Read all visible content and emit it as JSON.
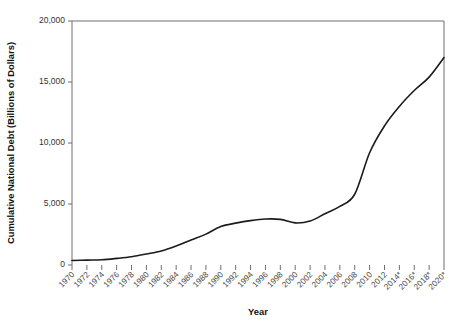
{
  "chart_data": {
    "type": "line",
    "title": "",
    "xlabel": "Year",
    "ylabel": "Cumulative National Debt (Billions of Dollars)",
    "xlim": [
      1970,
      2020
    ],
    "ylim": [
      0,
      20000
    ],
    "grid": false,
    "legend": null,
    "line_color": "#1b1b1b",
    "axis_color": "#6f6f6f",
    "note": "Years marked with an asterisk are projections",
    "ytick_labels": [
      "0",
      "5,000",
      "10,000",
      "15,000",
      "20,000"
    ],
    "ytick_values": [
      0,
      5000,
      10000,
      15000,
      20000
    ],
    "xtick_labels": [
      "1970",
      "1972",
      "1974",
      "1976",
      "1978",
      "1980",
      "1982",
      "1984",
      "1986",
      "1988",
      "1990",
      "1992",
      "1994",
      "1996",
      "1998",
      "2000",
      "2002",
      "2004",
      "2006",
      "2008",
      "2010",
      "2012",
      "2014*",
      "2016*",
      "2018*",
      "2020*"
    ],
    "categories": [
      1970,
      1972,
      1974,
      1976,
      1978,
      1980,
      1982,
      1984,
      1986,
      1988,
      1990,
      1992,
      1994,
      1996,
      1998,
      2000,
      2002,
      2004,
      2006,
      2008,
      2010,
      2012,
      2014,
      2016,
      2018,
      2020
    ],
    "values": [
      370,
      430,
      490,
      630,
      780,
      910,
      1140,
      1570,
      2130,
      2600,
      3230,
      4060,
      4690,
      5220,
      5530,
      5670,
      6200,
      7380,
      8510,
      10020,
      13560,
      16070,
      17820,
      19540,
      21500,
      23200
    ],
    "series": [
      {
        "name": "Cumulative National Debt",
        "points": [
          {
            "x": 1970,
            "y": 370
          },
          {
            "x": 1972,
            "y": 400
          },
          {
            "x": 1974,
            "y": 430
          },
          {
            "x": 1976,
            "y": 540
          },
          {
            "x": 1978,
            "y": 680
          },
          {
            "x": 1980,
            "y": 900
          },
          {
            "x": 1982,
            "y": 1150
          },
          {
            "x": 1984,
            "y": 1560
          },
          {
            "x": 1986,
            "y": 2050
          },
          {
            "x": 1988,
            "y": 2530
          },
          {
            "x": 1990,
            "y": 3150
          },
          {
            "x": 1992,
            "y": 3430
          },
          {
            "x": 1994,
            "y": 3640
          },
          {
            "x": 1996,
            "y": 3770
          },
          {
            "x": 1998,
            "y": 3740
          },
          {
            "x": 2000,
            "y": 3450
          },
          {
            "x": 2002,
            "y": 3600
          },
          {
            "x": 2004,
            "y": 4200
          },
          {
            "x": 2006,
            "y": 4800
          },
          {
            "x": 2008,
            "y": 5800
          },
          {
            "x": 2010,
            "y": 9200
          },
          {
            "x": 2012,
            "y": 11400
          },
          {
            "x": 2014,
            "y": 13000
          },
          {
            "x": 2016,
            "y": 14300
          },
          {
            "x": 2018,
            "y": 15400
          },
          {
            "x": 2020,
            "y": 17000
          }
        ]
      }
    ]
  },
  "axes": {
    "y_title": "Cumulative National Debt (Billions of Dollars)",
    "x_title": "Year"
  }
}
